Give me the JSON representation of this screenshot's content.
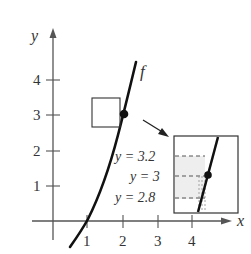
{
  "figure": {
    "type": "function-graph-with-zoom-inset",
    "axes": {
      "x_label": "x",
      "y_label": "y",
      "x_ticks": [
        "1",
        "2",
        "3",
        "4"
      ],
      "y_ticks": [
        "1",
        "2",
        "3",
        "4"
      ]
    },
    "curve": {
      "label": "f",
      "highlighted_point": [
        2,
        3
      ]
    },
    "inset": {
      "labels": [
        "y = 3.2",
        "y = 3",
        "y = 2.8"
      ]
    },
    "colors": {
      "ink": "#1a1a1a",
      "axis": "#555555",
      "shade": "#eeeeee"
    }
  }
}
